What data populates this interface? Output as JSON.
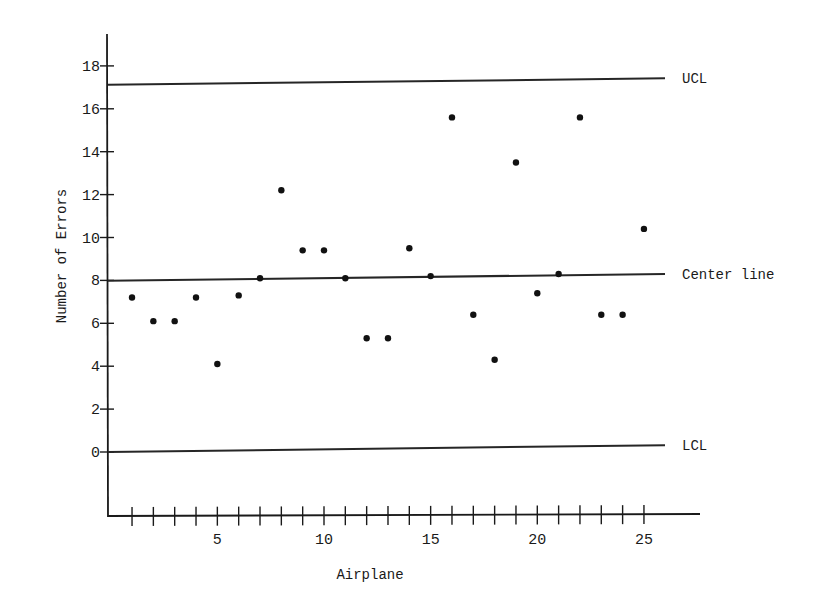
{
  "chart_data": {
    "type": "scatter",
    "title": "",
    "xlabel": "Airplane",
    "ylabel": "Number of Errors",
    "x": [
      1,
      2,
      3,
      4,
      5,
      6,
      7,
      8,
      9,
      10,
      11,
      12,
      13,
      14,
      15,
      16,
      17,
      18,
      19,
      20,
      21,
      22,
      23,
      24,
      25
    ],
    "series": [
      {
        "name": "Errors per airplane",
        "values": [
          7.2,
          6.1,
          6.1,
          7.2,
          4.1,
          7.3,
          8.1,
          12.2,
          9.4,
          9.4,
          8.1,
          5.3,
          5.3,
          9.5,
          8.2,
          15.6,
          6.4,
          4.3,
          13.5,
          7.4,
          8.3,
          15.6,
          6.4,
          6.4,
          10.4
        ]
      }
    ],
    "reference_lines": [
      {
        "name": "UCL",
        "label": "UCL",
        "value": 17.2
      },
      {
        "name": "Center line",
        "label": "Center line",
        "value": 8.1
      },
      {
        "name": "LCL",
        "label": "LCL",
        "value": 0.1
      }
    ],
    "x_ticks": [
      1,
      2,
      3,
      4,
      5,
      6,
      7,
      8,
      9,
      10,
      11,
      12,
      13,
      14,
      15,
      16,
      17,
      18,
      19,
      20,
      21,
      22,
      23,
      24,
      25
    ],
    "x_tick_labels": [
      "5",
      "10",
      "15",
      "20",
      "25"
    ],
    "y_ticks": [
      0,
      2,
      4,
      6,
      8,
      10,
      12,
      14,
      16,
      18
    ],
    "y_tick_labels": [
      "0",
      "2",
      "4",
      "6",
      "8",
      "10",
      "12",
      "14",
      "16",
      "18"
    ],
    "xlim": [
      0,
      27
    ],
    "ylim": [
      -3,
      19.5
    ],
    "grid": false,
    "legend": "none (lines labeled at right end)"
  },
  "labels": {
    "ucl": "UCL",
    "center": "Center line",
    "lcl": "LCL",
    "xaxis": "Airplane",
    "yaxis": "Number of Errors"
  }
}
